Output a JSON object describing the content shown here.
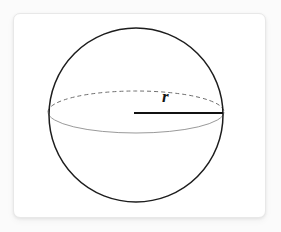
{
  "canvas": {
    "width": 281,
    "height": 232,
    "background_color": "#fbfbfb"
  },
  "card": {
    "background_color": "#ffffff",
    "border_color": "#e8e8e8",
    "corner_radius": 7,
    "x": 13,
    "y": 13,
    "width": 253,
    "height": 205
  },
  "diagram": {
    "sphere": {
      "center_x": 136,
      "center_y": 115,
      "radius": 87,
      "stroke_color": "#1d1d1d",
      "stroke_width": 1.5,
      "fill": "none"
    },
    "equator": {
      "center_x": 136,
      "center_y": 112,
      "radius_x": 88,
      "radius_y": 21,
      "back_arc_style": "dashed",
      "back_arc_color": "#6f6f6f",
      "back_arc_dash": "4 3",
      "front_arc_style": "solid",
      "front_arc_color": "#9a9a9a",
      "stroke_width": 1
    },
    "radius_line": {
      "x1": 134,
      "y1": 113,
      "x2": 223,
      "y2": 113,
      "stroke_color": "#111111",
      "stroke_width": 2.2
    },
    "radius_label": {
      "text": "r",
      "color": "#141414",
      "font_style": "italic",
      "font_weight": "bold",
      "font_size": 17,
      "x": 162,
      "y": 88
    }
  }
}
